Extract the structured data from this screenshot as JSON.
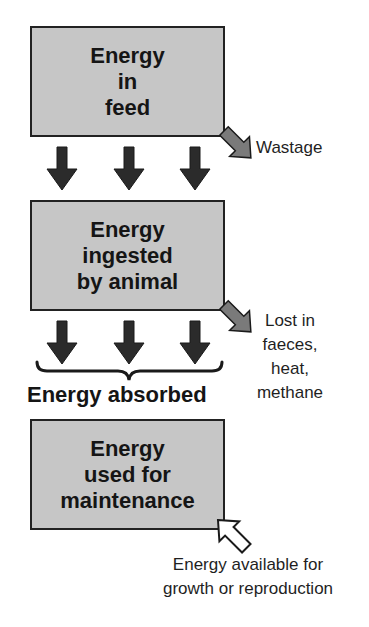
{
  "diagram": {
    "type": "energy-flow",
    "boxes": [
      {
        "id": "feed",
        "lines": [
          "Energy",
          "in",
          "feed"
        ]
      },
      {
        "id": "ingested",
        "lines": [
          "Energy",
          "ingested",
          "by animal"
        ]
      },
      {
        "id": "maintenance",
        "lines": [
          "Energy",
          "used for",
          "maintenance"
        ]
      }
    ],
    "losses": [
      {
        "from": "feed",
        "lines": [
          "Wastage"
        ],
        "arrow": "gray-outflow-arrow"
      },
      {
        "from": "ingested",
        "lines": [
          "Lost in",
          "faeces,",
          "heat,",
          "methane"
        ],
        "arrow": "gray-outflow-arrow"
      }
    ],
    "absorbed_label": "Energy absorbed",
    "available": {
      "lines": [
        "Energy available for",
        "growth or reproduction"
      ],
      "arrow": "white-hollow-arrow"
    },
    "colors": {
      "box_fill": "#c6c6c6",
      "box_border": "#222222",
      "down_arrow": "#2b2b2b",
      "loss_arrow": "#7a7a7a",
      "available_arrow": "#ffffff",
      "text": "#1a1a1a"
    }
  }
}
